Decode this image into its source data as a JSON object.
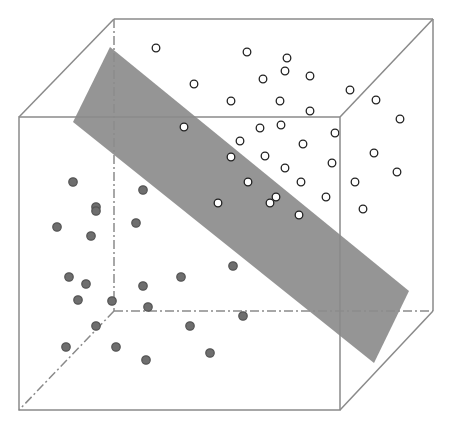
{
  "colors": {
    "edge": "#8a8a8a",
    "plane": "#8c8c8c",
    "class_a_fill": "#ffffff",
    "class_a_stroke": "#222222",
    "class_b_fill": "#6e6e6e",
    "class_b_stroke": "#555555",
    "background": "#ffffff"
  },
  "cube": {
    "front": {
      "x1": 19,
      "y1": 117,
      "x2": 340,
      "y2": 410
    },
    "back": {
      "x1": 114,
      "y1": 19,
      "x2": 433,
      "y2": 311
    }
  },
  "plane": {
    "points": [
      [
        110,
        47
      ],
      [
        73,
        122
      ],
      [
        374,
        363
      ],
      [
        409,
        291
      ]
    ]
  },
  "class_a_points": [
    [
      156,
      48
    ],
    [
      247,
      52
    ],
    [
      287,
      58
    ],
    [
      285,
      71
    ],
    [
      263,
      79
    ],
    [
      310,
      76
    ],
    [
      194,
      84
    ],
    [
      231,
      101
    ],
    [
      280,
      101
    ],
    [
      310,
      111
    ],
    [
      350,
      90
    ],
    [
      376,
      100
    ],
    [
      400,
      119
    ],
    [
      184,
      127
    ],
    [
      260,
      128
    ],
    [
      281,
      125
    ],
    [
      335,
      133
    ],
    [
      240,
      141
    ],
    [
      303,
      144
    ],
    [
      265,
      156
    ],
    [
      374,
      153
    ],
    [
      231,
      157
    ],
    [
      285,
      168
    ],
    [
      332,
      163
    ],
    [
      397,
      172
    ],
    [
      248,
      182
    ],
    [
      301,
      182
    ],
    [
      355,
      182
    ],
    [
      276,
      197
    ],
    [
      270,
      203
    ],
    [
      326,
      197
    ],
    [
      218,
      203
    ],
    [
      299,
      215
    ],
    [
      363,
      209
    ]
  ],
  "class_b_points": [
    [
      73,
      182
    ],
    [
      143,
      190
    ],
    [
      96,
      207
    ],
    [
      96,
      211
    ],
    [
      136,
      223
    ],
    [
      57,
      227
    ],
    [
      91,
      236
    ],
    [
      233,
      266
    ],
    [
      69,
      277
    ],
    [
      86,
      284
    ],
    [
      181,
      277
    ],
    [
      143,
      286
    ],
    [
      78,
      300
    ],
    [
      112,
      301
    ],
    [
      148,
      307
    ],
    [
      96,
      326
    ],
    [
      190,
      326
    ],
    [
      243,
      316
    ],
    [
      66,
      347
    ],
    [
      116,
      347
    ],
    [
      146,
      360
    ],
    [
      210,
      353
    ]
  ]
}
